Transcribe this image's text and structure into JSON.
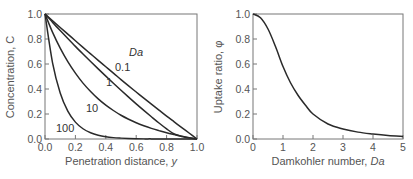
{
  "chart_data": [
    {
      "type": "line",
      "title": "",
      "xlabel": "Penetration distance, y",
      "xlabel_main": "Penetration distance, ",
      "xlabel_var": "y",
      "ylabel": "Concentration, C",
      "xlim": [
        0.0,
        1.0
      ],
      "ylim": [
        0.0,
        1.0
      ],
      "xticks": [
        "0.0",
        "0.2",
        "0.4",
        "0.6",
        "0.8",
        "1.0"
      ],
      "yticks": [
        "0.0",
        "0.2",
        "0.4",
        "0.6",
        "0.8",
        "1.0"
      ],
      "grid": false,
      "legend_title": "Da",
      "x": [
        0.0,
        0.05,
        0.1,
        0.15,
        0.2,
        0.25,
        0.3,
        0.35,
        0.4,
        0.45,
        0.5,
        0.55,
        0.6,
        0.65,
        0.7,
        0.75,
        0.8,
        0.85,
        0.9,
        0.95,
        1.0
      ],
      "series": [
        {
          "name": "0.1",
          "values": [
            1.0,
            0.946,
            0.892,
            0.839,
            0.786,
            0.733,
            0.681,
            0.629,
            0.578,
            0.527,
            0.475,
            0.425,
            0.376,
            0.327,
            0.279,
            0.231,
            0.183,
            0.137,
            0.091,
            0.046,
            0.0
          ]
        },
        {
          "name": "1",
          "values": [
            1.0,
            0.933,
            0.868,
            0.804,
            0.741,
            0.68,
            0.62,
            0.561,
            0.503,
            0.446,
            0.39,
            0.335,
            0.281,
            0.229,
            0.178,
            0.128,
            0.081,
            0.04,
            0.02,
            0.008,
            0.0
          ]
        },
        {
          "name": "10",
          "values": [
            1.0,
            0.853,
            0.727,
            0.619,
            0.527,
            0.447,
            0.38,
            0.321,
            0.271,
            0.228,
            0.19,
            0.158,
            0.13,
            0.106,
            0.085,
            0.067,
            0.05,
            0.036,
            0.023,
            0.011,
            0.0
          ]
        },
        {
          "name": "100",
          "values": [
            1.0,
            0.607,
            0.368,
            0.223,
            0.135,
            0.082,
            0.05,
            0.03,
            0.018,
            0.011,
            0.007,
            0.004,
            0.002,
            0.001,
            0.001,
            0.0,
            0.0,
            0.0,
            0.0,
            0.0,
            0.0
          ]
        }
      ]
    },
    {
      "type": "line",
      "title": "",
      "xlabel": "Damkohler number, Da",
      "xlabel_main": "Damkohler number, ",
      "xlabel_var": "Da",
      "ylabel": "Uptake ratio, φ",
      "xlim": [
        0,
        5
      ],
      "ylim": [
        0.0,
        1.0
      ],
      "xticks": [
        "0",
        "1",
        "2",
        "3",
        "4",
        "5"
      ],
      "yticks": [
        "0.0",
        "0.2",
        "0.4",
        "0.6",
        "0.8",
        "1.0"
      ],
      "grid": false,
      "x": [
        0,
        0.25,
        0.5,
        0.75,
        1.0,
        1.25,
        1.5,
        1.75,
        2.0,
        2.5,
        3.0,
        3.5,
        4.0,
        4.5,
        5.0
      ],
      "series": [
        {
          "name": "φ",
          "values": [
            1.0,
            0.97,
            0.88,
            0.74,
            0.58,
            0.45,
            0.35,
            0.27,
            0.2,
            0.12,
            0.08,
            0.055,
            0.04,
            0.028,
            0.02
          ]
        }
      ]
    }
  ]
}
